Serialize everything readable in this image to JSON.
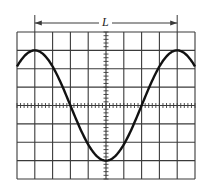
{
  "figure": {
    "type": "oscilloscope-screen-diagram",
    "dimension_label": "L",
    "colors": {
      "grid": "#3a3a3a",
      "trace": "#111111",
      "background": "#ffffff"
    }
  },
  "grid": {
    "divisions_x": 10,
    "divisions_y": 8,
    "minor_ticks_per_division": 5,
    "left": 17,
    "top": 32,
    "right": 195,
    "bottom": 179
  },
  "waveform": {
    "shape": "cosine",
    "amplitude_divisions": 3,
    "period_divisions": 8,
    "first_peak_division": 1,
    "trough_division": 5,
    "second_peak_division": 9
  },
  "dimension": {
    "from_division": 1,
    "to_division": 9,
    "label": "L",
    "arrow_y": 23
  }
}
